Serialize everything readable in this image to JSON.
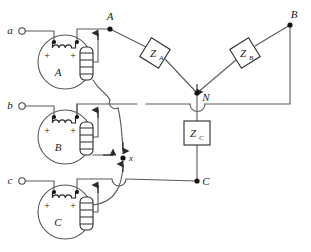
{
  "diagram": {
    "colors": {
      "wire": "#5a5a5a",
      "wire_dark": "#2b2b2b",
      "node_fill": "#151515",
      "text": "#1a1a1a",
      "background": "#ffffff",
      "box_fill": "#ffffff"
    },
    "source_terminals": [
      {
        "id": "a",
        "label": "a",
        "x": 16,
        "y": 31
      },
      {
        "id": "b",
        "label": "b",
        "x": 16,
        "y": 106
      },
      {
        "id": "c",
        "label": "c",
        "x": 16,
        "y": 181
      }
    ],
    "transformers": [
      {
        "id": "A",
        "label": "A",
        "cx": 65,
        "cy": 62,
        "r": 27,
        "primary_plus_left": "+",
        "primary_plus_right": "+"
      },
      {
        "id": "B",
        "label": "B",
        "cx": 65,
        "cy": 137,
        "r": 27,
        "primary_plus_left": "+",
        "primary_plus_right": "+"
      },
      {
        "id": "C",
        "label": "C",
        "cx": 65,
        "cy": 212,
        "r": 27,
        "primary_plus_left": "+",
        "primary_plus_right": "+"
      }
    ],
    "nodes": [
      {
        "id": "A",
        "label": "A",
        "x": 110,
        "y": 29
      },
      {
        "id": "B",
        "label": "B",
        "x": 290,
        "y": 25
      },
      {
        "id": "C",
        "label": "C",
        "x": 197,
        "y": 181
      },
      {
        "id": "N",
        "label": "N",
        "x": 197,
        "y": 93
      },
      {
        "id": "x",
        "label": "x",
        "x": 123,
        "y": 158
      }
    ],
    "impedances": [
      {
        "id": "ZA",
        "label": "Z",
        "sub": "A",
        "shape": "diamond",
        "cx": 155,
        "cy": 53
      },
      {
        "id": "ZB",
        "label": "Z",
        "sub": "B",
        "shape": "diamond",
        "cx": 245,
        "cy": 53
      },
      {
        "id": "ZC",
        "label": "Z",
        "sub": "C",
        "shape": "square",
        "cx": 197,
        "cy": 133
      }
    ]
  }
}
